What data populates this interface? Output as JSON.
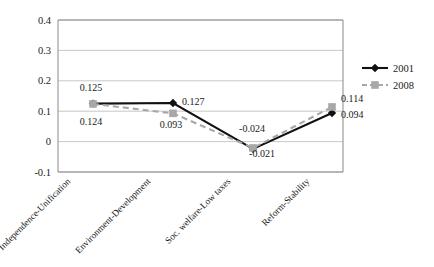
{
  "chart_data": {
    "type": "line",
    "title": "",
    "subtitle": "",
    "xlabel": "",
    "ylabel": "",
    "ylim": [
      -0.1,
      0.4
    ],
    "ytick_labels": [
      "0.4",
      "0.3",
      "0.2",
      "0.1",
      "0",
      "-0.1"
    ],
    "ytick_values": [
      0.4,
      0.3,
      0.2,
      0.1,
      0,
      -0.1
    ],
    "grid": true,
    "legend_position": "right",
    "categories": [
      "Independence-Unification",
      "Environment-Development",
      "Soc. welfare-Low taxes",
      "Reform-Stability"
    ],
    "series": [
      {
        "name": "2001",
        "color": "#111111",
        "marker": "diamond",
        "linestyle": "solid",
        "values": [
          0.125,
          0.127,
          -0.024,
          0.094
        ],
        "value_labels": [
          "0.125",
          "0.127",
          "-0.024",
          "0.094"
        ]
      },
      {
        "name": "2008",
        "color": "#a8a8a8",
        "marker": "square",
        "linestyle": "dashed",
        "values": [
          0.124,
          0.093,
          -0.021,
          0.114
        ],
        "value_labels": [
          "0.124",
          "0.093",
          "-0.021",
          "0.114"
        ]
      }
    ],
    "annotations": [
      {
        "id": "lbl-2001-0",
        "text": "0.125",
        "x": 91,
        "y": 91,
        "anchor": "middle"
      },
      {
        "id": "lbl-2008-0",
        "text": "0.124",
        "x": 91,
        "y": 125,
        "anchor": "middle"
      },
      {
        "id": "lbl-2001-1",
        "text": "0.127",
        "x": 182,
        "y": 105,
        "anchor": "start"
      },
      {
        "id": "lbl-2008-1",
        "text": "0.093",
        "x": 171,
        "y": 128,
        "anchor": "middle"
      },
      {
        "id": "lbl-2001-2",
        "text": "-0.024",
        "x": 252,
        "y": 132,
        "anchor": "middle"
      },
      {
        "id": "lbl-2008-2",
        "text": "-0.021",
        "x": 262,
        "y": 157,
        "anchor": "middle"
      },
      {
        "id": "lbl-2008-3",
        "text": "0.114",
        "x": 341,
        "y": 102,
        "anchor": "start"
      },
      {
        "id": "lbl-2001-3",
        "text": "0.094",
        "x": 341,
        "y": 118,
        "anchor": "start"
      }
    ]
  },
  "legend": {
    "entries": [
      {
        "label": "2001",
        "color": "#111111",
        "style": "solid",
        "marker": "diamond"
      },
      {
        "label": "2008",
        "color": "#a8a8a8",
        "style": "dashed",
        "marker": "square"
      }
    ]
  }
}
